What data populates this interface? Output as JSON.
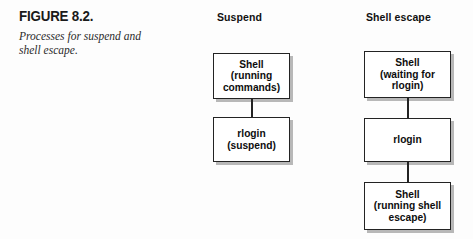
{
  "figure": {
    "title": "FIGURE 8.2.",
    "description": "Processes for suspend and shell escape."
  },
  "colors": {
    "box_border": "#232323",
    "box_fill": "#ffffff",
    "box_shadow": "#b8b8b8",
    "text": "#0d0d0d",
    "page_background": "#ffffff"
  },
  "diagram": {
    "columns": [
      {
        "id": "suspend",
        "title": "Suspend",
        "nodes": [
          {
            "id": "suspend-shell",
            "label": "Shell\n(running\ncommands)"
          },
          {
            "id": "suspend-rlogin",
            "label": "rlogin\n(suspend)"
          }
        ],
        "connectors": [
          {
            "id": "suspend-connector-1",
            "from": "suspend-shell",
            "to": "suspend-rlogin"
          }
        ]
      },
      {
        "id": "shell-escape",
        "title": "Shell escape",
        "nodes": [
          {
            "id": "escape-shell-waiting",
            "label": "Shell\n(waiting for\nrlogin)"
          },
          {
            "id": "escape-rlogin",
            "label": "rlogin"
          },
          {
            "id": "escape-shell-running",
            "label": "Shell\n(running shell\nescape)"
          }
        ],
        "connectors": [
          {
            "id": "escape-connector-1",
            "from": "escape-shell-waiting",
            "to": "escape-rlogin"
          },
          {
            "id": "escape-connector-2",
            "from": "escape-rlogin",
            "to": "escape-shell-running"
          }
        ]
      }
    ]
  }
}
